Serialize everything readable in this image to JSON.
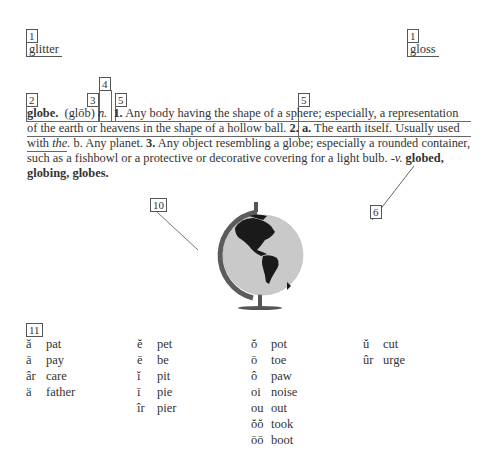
{
  "guide_words": {
    "left": {
      "callout": "1",
      "word": "glitter"
    },
    "right": {
      "callout": "1",
      "word": "gloss"
    }
  },
  "callouts": {
    "entry_word": "2",
    "pronunciation": "3",
    "part_of_speech": "4",
    "definition_1": "5",
    "definition_2": "5",
    "inflected_forms": "6",
    "illustration": "10",
    "pronunciation_key": "11"
  },
  "entry": {
    "headword": "globe.",
    "pronunciation": "(glōb)",
    "part_of_speech": "n.",
    "lines": [
      {
        "parts": [
          {
            "text": "1.",
            "style": "bold"
          },
          {
            "text": " Any body having the shape of a sphere; especially, a representation",
            "style": "normal"
          }
        ]
      },
      {
        "parts": [
          {
            "text": "of the earth or heavens in the shape of a hollow ball. ",
            "style": "normal"
          },
          {
            "text": "2. a.",
            "style": "bold"
          },
          {
            "text": " The earth itself. Usually used",
            "style": "normal"
          }
        ]
      },
      {
        "parts": [
          {
            "text": "with ",
            "style": "normal"
          },
          {
            "text": "the.",
            "style": "italic"
          },
          {
            "text": "  b. Any planet.  ",
            "style": "normal"
          },
          {
            "text": "3.",
            "style": "bold"
          },
          {
            "text": " Any object resembling a globe; especially a rounded container,",
            "style": "normal"
          }
        ]
      },
      {
        "parts": [
          {
            "text": "such as a fishbowl or a protective or decorative covering for a light bulb. ",
            "style": "normal"
          },
          {
            "text": "-v.",
            "style": "italic"
          },
          {
            "text": " globed,",
            "style": "bold"
          }
        ]
      },
      {
        "parts": [
          {
            "text": "globing, globes.",
            "style": "bold"
          }
        ]
      }
    ]
  },
  "illustration": {
    "icon": "globe-icon",
    "label": "globe illustration"
  },
  "pronunciation_key": {
    "columns": [
      [
        {
          "symbol": "ă",
          "word": "pat"
        },
        {
          "symbol": "ā",
          "word": "pay"
        },
        {
          "symbol": "âr",
          "word": "care"
        },
        {
          "symbol": "ä",
          "word": "father"
        }
      ],
      [
        {
          "symbol": "ĕ",
          "word": "pet"
        },
        {
          "symbol": "ē",
          "word": "be"
        },
        {
          "symbol": "ĭ",
          "word": "pit"
        },
        {
          "symbol": "ī",
          "word": "pie"
        },
        {
          "symbol": "îr",
          "word": "pier"
        }
      ],
      [
        {
          "symbol": "ŏ",
          "word": "pot"
        },
        {
          "symbol": "ō",
          "word": "toe"
        },
        {
          "symbol": "ô",
          "word": "paw"
        },
        {
          "symbol": "oi",
          "word": "noise"
        },
        {
          "symbol": "ou",
          "word": "out"
        },
        {
          "symbol": "ŏŏ",
          "word": "took"
        },
        {
          "symbol": "ōō",
          "word": "boot"
        }
      ],
      [
        {
          "symbol": "ŭ",
          "word": "cut"
        },
        {
          "symbol": "ûr",
          "word": "urge"
        }
      ]
    ]
  }
}
